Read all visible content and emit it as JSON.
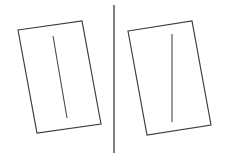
{
  "figure": {
    "type": "line-drawing",
    "canvas": {
      "width": 225,
      "height": 154,
      "background": "#ffffff"
    },
    "colors": {
      "frame_stroke": "#3b3b3b",
      "rod_stroke": "#4a4a4a",
      "divider_stroke": "#3a3a3a",
      "background": "#ffffff"
    },
    "divider": {
      "label": "vertical divider",
      "x1": 114,
      "y1": 5,
      "x2": 114,
      "y2": 153,
      "stroke_width": 1.3
    },
    "panels": [
      {
        "id": "left-panel",
        "label": "Left panel",
        "frame": {
          "label": "tilted rectangle frame",
          "points": "18,30 82,21 101,124 37,133",
          "corners": [
            {
              "name": "top-left",
              "x": 18,
              "y": 30
            },
            {
              "name": "top-right",
              "x": 82,
              "y": 21
            },
            {
              "name": "bottom-right",
              "x": 101,
              "y": 124
            },
            {
              "name": "bottom-left",
              "x": 37,
              "y": 133
            }
          ],
          "stroke_width": 1.15
        },
        "rod": {
          "label": "tilted rod",
          "orientation": "tilted",
          "x1": 53,
          "y1": 36,
          "x2": 67,
          "y2": 118,
          "stroke_width": 1.1
        }
      },
      {
        "id": "right-panel",
        "label": "Right panel",
        "frame": {
          "label": "tilted rectangle frame",
          "points": "128,31 192,21 211,125 147,135",
          "corners": [
            {
              "name": "top-left",
              "x": 128,
              "y": 31
            },
            {
              "name": "top-right",
              "x": 192,
              "y": 21
            },
            {
              "name": "bottom-right",
              "x": 211,
              "y": 125
            },
            {
              "name": "bottom-left",
              "x": 147,
              "y": 135
            }
          ],
          "stroke_width": 1.15
        },
        "rod": {
          "label": "vertical rod",
          "orientation": "vertical",
          "x1": 172,
          "y1": 34,
          "x2": 172,
          "y2": 122,
          "stroke_width": 1.1
        }
      }
    ]
  }
}
